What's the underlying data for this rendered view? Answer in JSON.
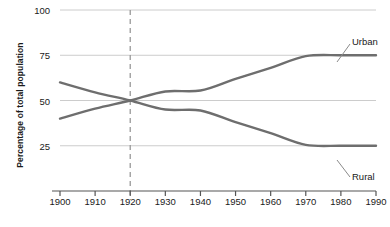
{
  "chart_data": {
    "type": "line",
    "title": "",
    "xlabel": "",
    "ylabel": "Percentage of total population",
    "x": [
      1900,
      1910,
      1920,
      1930,
      1940,
      1950,
      1960,
      1970,
      1980,
      1990
    ],
    "xlim": [
      1900,
      1990
    ],
    "ylim": [
      0,
      100
    ],
    "xticks": [
      "1900",
      "1910",
      "1920",
      "1930",
      "1940",
      "1950",
      "1960",
      "1970",
      "1980",
      "1990"
    ],
    "yticks": [
      "25",
      "50",
      "75",
      "100"
    ],
    "ytick_values": [
      25,
      50,
      75,
      100
    ],
    "grid": "horizontal",
    "legend_position": "inline-labels",
    "series": [
      {
        "name": "Urban",
        "values": [
          40,
          45.5,
          50,
          55,
          55.5,
          62,
          68,
          74.5,
          75,
          75
        ],
        "color": "#6e6e6e"
      },
      {
        "name": "Rural",
        "values": [
          60,
          54.5,
          50,
          45,
          44.5,
          38,
          32,
          25.5,
          25,
          25
        ]
      }
    ],
    "annotations": [
      {
        "text": "Urban",
        "x": 1975,
        "y": 85
      },
      {
        "text": "Rural",
        "x": 1975,
        "y": 14
      }
    ],
    "reference_line": {
      "x": 1920,
      "style": "dashed",
      "color": "#999999"
    }
  },
  "axis": {
    "line_color": "#555555",
    "grid_color": "#cccccc",
    "text_color": "#1a1a1a"
  }
}
